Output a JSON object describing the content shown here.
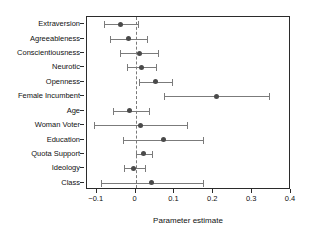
{
  "chart_data": {
    "type": "scatter",
    "subtype": "coefficient-forest-plot",
    "title": "",
    "xlabel": "Parameter estimate",
    "ylabel": "",
    "xlim": [
      -0.125,
      0.4
    ],
    "ylim": [
      0,
      13
    ],
    "grid": false,
    "legend": null,
    "zero_reference_line": 0,
    "xticks": [
      -0.1,
      0,
      0.1,
      0.2,
      0.3,
      0.4
    ],
    "xticklabels": [
      "−0.1",
      "0",
      "0.1",
      "0.2",
      "0.3",
      "0.4"
    ],
    "categories": [
      "Extraversion",
      "Agreeableness",
      "Conscientiousness",
      "Neurotic",
      "Openness",
      "Female Incumbent",
      "Age",
      "Woman Voter",
      "Education",
      "Quota Support",
      "Ideology",
      "Class"
    ],
    "estimates": [
      -0.039,
      -0.018,
      0.011,
      0.016,
      0.052,
      0.208,
      -0.015,
      0.012,
      0.073,
      0.021,
      -0.006,
      0.042
    ],
    "ci_lower": [
      -0.08,
      -0.066,
      -0.04,
      -0.022,
      0.009,
      0.073,
      -0.057,
      -0.108,
      -0.032,
      0.0,
      -0.029,
      -0.088
    ],
    "ci_upper": [
      0.005,
      0.03,
      0.058,
      0.053,
      0.095,
      0.343,
      0.035,
      0.133,
      0.173,
      0.043,
      0.023,
      0.173
    ],
    "points": [
      {
        "label": "Extraversion",
        "estimate": -0.039,
        "ci_lower": -0.08,
        "ci_upper": 0.005
      },
      {
        "label": "Agreeableness",
        "estimate": -0.018,
        "ci_lower": -0.066,
        "ci_upper": 0.03
      },
      {
        "label": "Conscientiousness",
        "estimate": 0.011,
        "ci_lower": -0.04,
        "ci_upper": 0.058
      },
      {
        "label": "Neurotic",
        "estimate": 0.016,
        "ci_lower": -0.022,
        "ci_upper": 0.053
      },
      {
        "label": "Openness",
        "estimate": 0.052,
        "ci_lower": 0.009,
        "ci_upper": 0.095
      },
      {
        "label": "Female Incumbent",
        "estimate": 0.208,
        "ci_lower": 0.073,
        "ci_upper": 0.343
      },
      {
        "label": "Age",
        "estimate": -0.015,
        "ci_lower": -0.057,
        "ci_upper": 0.035
      },
      {
        "label": "Woman Voter",
        "estimate": 0.012,
        "ci_lower": -0.108,
        "ci_upper": 0.133
      },
      {
        "label": "Education",
        "estimate": 0.073,
        "ci_lower": -0.032,
        "ci_upper": 0.173
      },
      {
        "label": "Quota Support",
        "estimate": 0.021,
        "ci_lower": 0.0,
        "ci_upper": 0.043
      },
      {
        "label": "Ideology",
        "estimate": -0.006,
        "ci_lower": -0.029,
        "ci_upper": 0.023
      },
      {
        "label": "Class",
        "estimate": 0.042,
        "ci_lower": -0.088,
        "ci_upper": 0.173
      }
    ],
    "colors": {
      "point": "#4a4a4a",
      "interval": "#7b7b7b",
      "axis": "#2b2b2b",
      "zero_line": "#7a7a7a",
      "background": "#ffffff"
    }
  }
}
